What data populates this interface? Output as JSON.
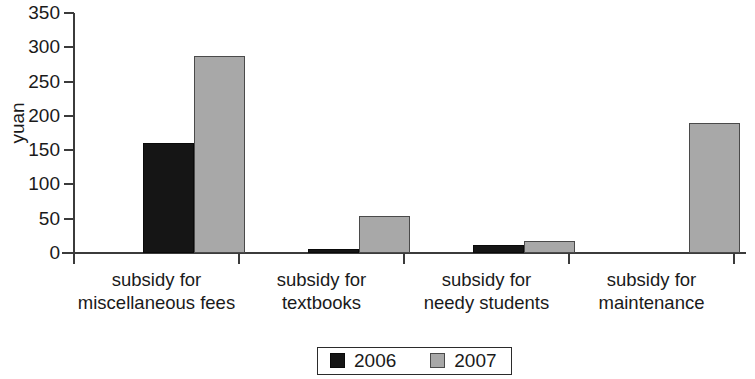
{
  "chart_data": {
    "type": "bar",
    "title": "",
    "xlabel": "",
    "ylabel": "yuan",
    "ylim": [
      0,
      350
    ],
    "yticks": [
      0,
      50,
      100,
      150,
      200,
      250,
      300,
      350
    ],
    "grid": false,
    "legend_position": "bottom-center",
    "categories": [
      "subsidy for miscellaneous fees",
      "subsidy for textbooks",
      "subsidy for needy students",
      "subsidy for maintenance"
    ],
    "category_lines": [
      [
        "subsidy for",
        "miscellaneous fees"
      ],
      [
        "subsidy for",
        "textbooks"
      ],
      [
        "subsidy for",
        "needy students"
      ],
      [
        "subsidy for",
        "maintenance"
      ]
    ],
    "series": [
      {
        "name": "2006",
        "color": "#151515",
        "values": [
          160,
          6,
          12,
          0
        ]
      },
      {
        "name": "2007",
        "color": "#a8a8a8",
        "values": [
          288,
          54,
          18,
          190
        ]
      }
    ]
  },
  "axis": {
    "ylabel": "yuan",
    "ytick_labels": [
      "350",
      "300",
      "250",
      "200",
      "150",
      "100",
      "50",
      "0"
    ]
  },
  "legend": {
    "items": [
      {
        "label": "2006",
        "swatch": "black-square-swatch"
      },
      {
        "label": "2007",
        "swatch": "gray-square-swatch"
      }
    ]
  }
}
